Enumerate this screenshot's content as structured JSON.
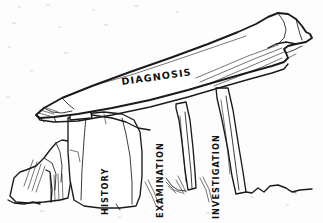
{
  "figure": {
    "medium": "pen and ink line drawing",
    "background_color": "#fdfdfd",
    "ink_color": "#1a1a1a"
  },
  "labels": {
    "capstone": {
      "text": "DIAGNOSIS",
      "orientation": "horizontal",
      "rotation_deg": -8,
      "x": 122,
      "y": 85
    },
    "pillars": [
      {
        "text": "HISTORY",
        "orientation": "vertical",
        "rotation_deg": -90,
        "x": 108,
        "y": 215
      },
      {
        "text": "EXAMINATION",
        "orientation": "vertical",
        "rotation_deg": -90,
        "x": 163,
        "y": 218
      },
      {
        "text": "INVESTIGATION",
        "orientation": "vertical",
        "rotation_deg": -90,
        "x": 219,
        "y": 219
      }
    ]
  },
  "elements": {
    "capstone_name": "capstone-stone",
    "pillar_names": [
      "pillar-history",
      "pillar-examination",
      "pillar-investigation"
    ],
    "outcrop_name": "rock-outcrop-left",
    "ground_name": "ground-line"
  }
}
